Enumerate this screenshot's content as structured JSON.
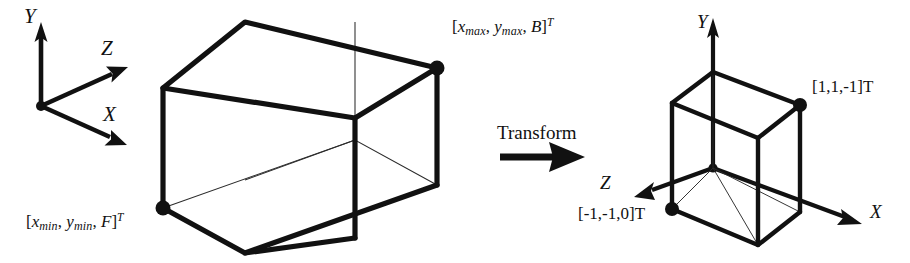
{
  "figure": {
    "ink_color": "#111111",
    "background_color": "#ffffff",
    "hidden_edge_color": "#2b2b2b"
  },
  "left_panel": {
    "axes": {
      "y_label": "Y",
      "z_label": "Z",
      "x_label": "X",
      "origin_name": "origin"
    },
    "box": {
      "near_corner_label": {
        "open_bracket": "[",
        "x_var": "x",
        "x_sub": "min",
        "sep1": ", ",
        "y_var": "y",
        "y_sub": "min",
        "sep2": ", ",
        "z_var": "F",
        "close_bracket": "]",
        "transpose": "T",
        "full_text": "[xmin, ymin, F]T"
      },
      "far_corner_label": {
        "open_bracket": "[",
        "x_var": "x",
        "x_sub": "max",
        "sep1": ", ",
        "y_var": "y",
        "y_sub": "max",
        "sep2": ", ",
        "z_var": "B",
        "close_bracket": "]",
        "transpose": "T",
        "full_text": "[xmax, ymax, B]T"
      }
    }
  },
  "middle_panel": {
    "transform_label": "Transform",
    "arrow_name": "transform-arrow"
  },
  "right_panel": {
    "axes": {
      "y_label": "Y",
      "z_label": "Z",
      "x_label": "X",
      "origin_name": "origin"
    },
    "box": {
      "far_corner_label": "[1,1,-1]",
      "far_corner_transpose": "T",
      "near_corner_label": "[-1,-1,0]",
      "near_corner_transpose": "T"
    }
  }
}
